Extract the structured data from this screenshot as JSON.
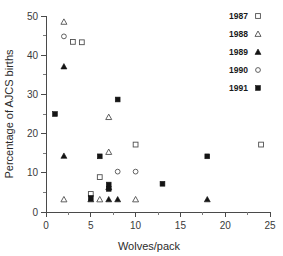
{
  "chart_data": {
    "type": "scatter",
    "title": "",
    "xlabel": "Wolves/pack",
    "ylabel": "Percentage of AJCS births",
    "xlim": [
      0,
      25
    ],
    "ylim": [
      0,
      50
    ],
    "xticks": [
      0,
      5,
      10,
      15,
      20,
      25
    ],
    "yticks": [
      0,
      10,
      20,
      30,
      40,
      50
    ],
    "xtick_labels": [
      "0",
      "5",
      "10",
      "15",
      "20",
      "25"
    ],
    "ytick_labels": [
      "0",
      "10",
      "20",
      "30",
      "40",
      "50"
    ],
    "grid": false,
    "minor_ticks": true,
    "legend_position": "top-right-outside",
    "series": [
      {
        "name": "1987",
        "marker": "open-square",
        "points": [
          {
            "x": 3,
            "y": 43.4
          },
          {
            "x": 4,
            "y": 43.3
          },
          {
            "x": 6,
            "y": 8.9
          },
          {
            "x": 5,
            "y": 4.6
          },
          {
            "x": 10,
            "y": 17.2
          },
          {
            "x": 24,
            "y": 17.2
          }
        ]
      },
      {
        "name": "1988",
        "marker": "open-triangle",
        "points": [
          {
            "x": 2,
            "y": 48.5
          },
          {
            "x": 7,
            "y": 24.2
          },
          {
            "x": 7,
            "y": 15.3
          },
          {
            "x": 2,
            "y": 3.2
          },
          {
            "x": 6,
            "y": 3.2
          },
          {
            "x": 10,
            "y": 3.2
          }
        ]
      },
      {
        "name": "1989",
        "marker": "filled-triangle",
        "points": [
          {
            "x": 2,
            "y": 37.1
          },
          {
            "x": 2,
            "y": 14.3
          },
          {
            "x": 7,
            "y": 6.3
          },
          {
            "x": 5,
            "y": 3.2
          },
          {
            "x": 7,
            "y": 3.2
          },
          {
            "x": 8,
            "y": 3.2
          },
          {
            "x": 18,
            "y": 3.2
          }
        ]
      },
      {
        "name": "1990",
        "marker": "open-circle",
        "points": [
          {
            "x": 2,
            "y": 44.8
          },
          {
            "x": 8,
            "y": 10.3
          },
          {
            "x": 10,
            "y": 10.3
          }
        ]
      },
      {
        "name": "1991",
        "marker": "filled-square",
        "points": [
          {
            "x": 1,
            "y": 25.0
          },
          {
            "x": 8,
            "y": 28.7
          },
          {
            "x": 6,
            "y": 14.2
          },
          {
            "x": 18,
            "y": 14.2
          },
          {
            "x": 7,
            "y": 7.0
          },
          {
            "x": 13,
            "y": 7.2
          },
          {
            "x": 7,
            "y": 5.9
          },
          {
            "x": 5,
            "y": 3.6
          }
        ]
      }
    ]
  },
  "legend": {
    "entries": [
      {
        "label": "1987",
        "marker": "open-square"
      },
      {
        "label": "1988",
        "marker": "open-triangle"
      },
      {
        "label": "1989",
        "marker": "filled-triangle"
      },
      {
        "label": "1990",
        "marker": "open-circle"
      },
      {
        "label": "1991",
        "marker": "filled-square"
      }
    ]
  },
  "colors": {
    "axis": "#4a4a4a",
    "marker_stroke": "#4f4f4f",
    "marker_fill": "#141414",
    "text": "#2b2b2b",
    "background": "#ffffff"
  }
}
